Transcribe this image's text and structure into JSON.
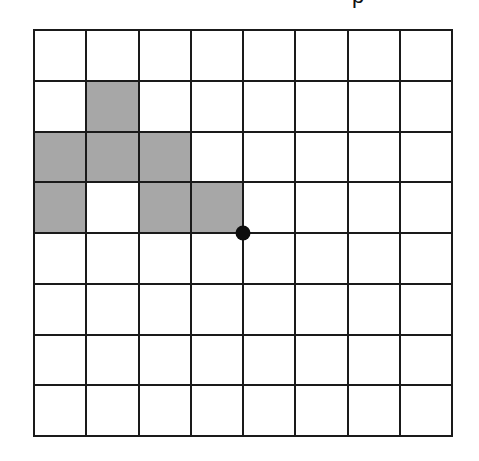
{
  "title_fragment": "p",
  "grid": {
    "rows": 8,
    "cols": 8,
    "line_color": "#1a1a1a",
    "fill_color": "#ffffff",
    "shade_color": "#a7a7a7",
    "shaded_cells": [
      {
        "row": 1,
        "col": 1
      },
      {
        "row": 2,
        "col": 0
      },
      {
        "row": 2,
        "col": 1
      },
      {
        "row": 2,
        "col": 2
      },
      {
        "row": 3,
        "col": 0
      },
      {
        "row": 3,
        "col": 2
      },
      {
        "row": 3,
        "col": 3
      }
    ]
  },
  "marker": {
    "type": "dot",
    "grid_point": {
      "row": 4,
      "col": 4
    },
    "color": "#0d0d0d"
  }
}
